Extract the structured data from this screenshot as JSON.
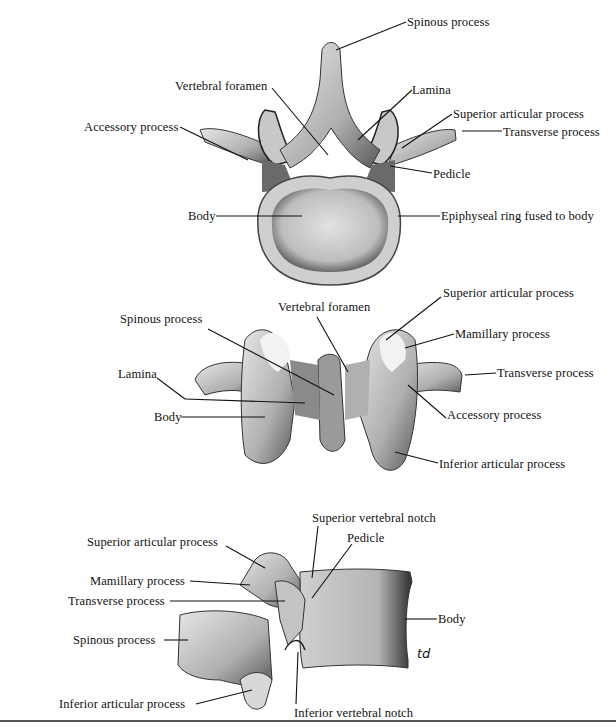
{
  "figure": {
    "views": [
      {
        "id": "superior-view",
        "labels": {
          "spinous_process": "Spinous process",
          "vertebral_foramen": "Vertebral foramen",
          "lamina": "Lamina",
          "accessory_process": "Accessory process",
          "superior_articular_process": "Superior articular process",
          "transverse_process": "Transverse process",
          "pedicle": "Pedicle",
          "body": "Body",
          "epiphyseal_ring": "Epiphyseal ring fused to body"
        }
      },
      {
        "id": "posterior-view",
        "labels": {
          "superior_articular_process": "Superior articular process",
          "vertebral_foramen": "Vertebral foramen",
          "spinous_process": "Spinous process",
          "mamillary_process": "Mamillary process",
          "lamina": "Lamina",
          "transverse_process": "Transverse process",
          "body": "Body",
          "accessory_process": "Accessory process",
          "inferior_articular_process": "Inferior articular process"
        }
      },
      {
        "id": "lateral-view",
        "labels": {
          "superior_vertebral_notch": "Superior vertebral notch",
          "superior_articular_process": "Superior articular process",
          "pedicle": "Pedicle",
          "mamillary_process": "Mamillary process",
          "transverse_process": "Transverse process",
          "body": "Body",
          "spinous_process": "Spinous process",
          "inferior_articular_process": "Inferior articular process",
          "inferior_vertebral_notch": "Inferior vertebral notch"
        },
        "signature": "td"
      }
    ],
    "colors": {
      "bone_light": "#d9d9d9",
      "bone_mid": "#a8a8a8",
      "bone_dark": "#3a3a3a",
      "leader": "#111111"
    }
  }
}
